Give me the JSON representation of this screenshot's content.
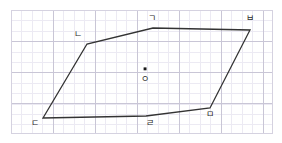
{
  "figure": {
    "title": "",
    "shape_name": "hexagon",
    "stroke_color": "#333333",
    "grid_color": "#c9c6d6",
    "background_color": "#ffffff",
    "canvas": {
      "width": 282,
      "height": 143
    },
    "grid_area": {
      "x": 11,
      "y": 10,
      "width": 262,
      "height": 124,
      "major_spacing_x": 42,
      "major_spacing_y": 31,
      "minor_spacing": 10.4
    },
    "polygon_points": "153,28 250,30 210,108 146,116 43,118 87,44",
    "vertices": [
      {
        "id": "a",
        "label": "ㄱ",
        "x": 153,
        "y": 28,
        "label_x": 148,
        "label_y": 14
      },
      {
        "id": "b",
        "label": "ㅂ",
        "x": 250,
        "y": 30,
        "label_x": 246,
        "label_y": 14
      },
      {
        "id": "m",
        "label": "ㅁ",
        "x": 210,
        "y": 108,
        "label_x": 206,
        "label_y": 110
      },
      {
        "id": "r",
        "label": "ㄹ",
        "x": 146,
        "y": 116,
        "label_x": 146,
        "label_y": 119
      },
      {
        "id": "d",
        "label": "ㄷ",
        "x": 43,
        "y": 118,
        "label_x": 31,
        "label_y": 119
      },
      {
        "id": "n",
        "label": "ㄴ",
        "x": 87,
        "y": 44,
        "label_x": 74,
        "label_y": 30
      }
    ],
    "center": {
      "label": "ㅇ",
      "dot_x": 145,
      "dot_y": 69,
      "dot_radius": 1.6,
      "label_x": 141,
      "label_y": 75
    }
  }
}
